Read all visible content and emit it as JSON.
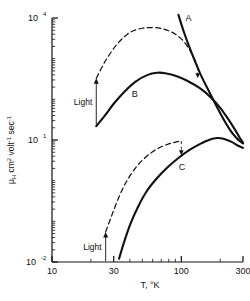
{
  "chart_data": {
    "type": "line",
    "title": "",
    "subtitle": "",
    "xlabel": "T,  °K",
    "ylabel": "μH cm2 volt-1 sec-1",
    "ylabel_parts": {
      "mu": "μ",
      "sub_h": "H",
      "cm": " cm",
      "cm_exp": "2",
      "volt": " volt",
      "volt_exp": "-1",
      "sec": " sec",
      "sec_exp": "-1"
    },
    "xscale": "log",
    "yscale": "log",
    "xlim": [
      10,
      300
    ],
    "ylim": [
      0.01,
      10000
    ],
    "grid": false,
    "legend_position": "inline-labels",
    "xticks": [
      {
        "value": 10,
        "label": "10",
        "major": true
      },
      {
        "value": 20,
        "label": "",
        "major": false
      },
      {
        "value": 30,
        "label": "30",
        "major": true
      },
      {
        "value": 40,
        "label": "",
        "major": false
      },
      {
        "value": 50,
        "label": "",
        "major": false
      },
      {
        "value": 60,
        "label": "",
        "major": false
      },
      {
        "value": 70,
        "label": "",
        "major": false
      },
      {
        "value": 80,
        "label": "",
        "major": false
      },
      {
        "value": 90,
        "label": "",
        "major": false
      },
      {
        "value": 100,
        "label": "100",
        "major": true
      },
      {
        "value": 200,
        "label": "",
        "major": false
      },
      {
        "value": 300,
        "label": "300",
        "major": true
      }
    ],
    "ytick_labels": [
      {
        "value": 10000,
        "mantissa": "10",
        "exponent": "4"
      },
      {
        "value": 10,
        "mantissa": "10",
        "exponent": "1"
      },
      {
        "value": 0.01,
        "mantissa": "10",
        "exponent": "-2"
      }
    ],
    "series": [
      {
        "name": "A",
        "label": "A",
        "style": "solid",
        "comment": "steeply falling branch from upper right",
        "points": [
          [
            95,
            12000
          ],
          [
            105,
            4400
          ],
          [
            120,
            1400
          ],
          [
            140,
            430
          ],
          [
            165,
            150
          ],
          [
            190,
            62
          ],
          [
            215,
            30
          ],
          [
            240,
            17
          ],
          [
            265,
            11.5
          ],
          [
            285,
            9.2
          ],
          [
            300,
            8.2
          ]
        ]
      },
      {
        "name": "B",
        "label": "B",
        "style": "solid",
        "comment": "dark-condition curve, peak near 60 K",
        "points": [
          [
            22,
            22
          ],
          [
            26,
            42
          ],
          [
            30,
            78
          ],
          [
            36,
            150
          ],
          [
            44,
            270
          ],
          [
            55,
            400
          ],
          [
            65,
            450
          ],
          [
            75,
            440
          ],
          [
            90,
            380
          ],
          [
            110,
            290
          ],
          [
            140,
            185
          ],
          [
            170,
            110
          ],
          [
            200,
            62
          ],
          [
            230,
            33
          ],
          [
            260,
            18
          ],
          [
            285,
            11
          ],
          [
            300,
            8.6
          ]
        ]
      },
      {
        "name": "B-light",
        "label": "",
        "style": "dashed",
        "comment": "curve B under illumination",
        "points": [
          [
            22,
            330
          ],
          [
            26,
            900
          ],
          [
            32,
            2300
          ],
          [
            40,
            4400
          ],
          [
            50,
            5600
          ],
          [
            62,
            5800
          ],
          [
            75,
            5200
          ],
          [
            90,
            4000
          ],
          [
            105,
            2600
          ],
          [
            118,
            1500
          ],
          [
            128,
            900
          ],
          [
            134,
            620
          ]
        ]
      },
      {
        "name": "C",
        "label": "C",
        "style": "solid",
        "comment": "lower dark curve, broad maximum near 190 K",
        "points": [
          [
            33,
            0.012
          ],
          [
            36,
            0.03
          ],
          [
            40,
            0.08
          ],
          [
            46,
            0.22
          ],
          [
            54,
            0.55
          ],
          [
            64,
            1.1
          ],
          [
            78,
            2.1
          ],
          [
            95,
            3.6
          ],
          [
            115,
            5.6
          ],
          [
            140,
            8.0
          ],
          [
            165,
            10.2
          ],
          [
            190,
            11.2
          ],
          [
            215,
            10.6
          ],
          [
            245,
            9.0
          ],
          [
            275,
            7.2
          ],
          [
            300,
            6.4
          ]
        ]
      },
      {
        "name": "C-light",
        "label": "",
        "style": "dashed",
        "comment": "curve C under illumination",
        "points": [
          [
            26,
            0.055
          ],
          [
            29,
            0.14
          ],
          [
            33,
            0.4
          ],
          [
            38,
            1.0
          ],
          [
            45,
            2.2
          ],
          [
            54,
            4.0
          ],
          [
            66,
            6.2
          ],
          [
            80,
            8.0
          ],
          [
            92,
            9.0
          ],
          [
            100,
            9.4
          ]
        ]
      }
    ],
    "annotations": [
      {
        "name": "light-arrow-upper",
        "text": "Light",
        "x_at": 22,
        "from_value": 22,
        "to_value": 330,
        "arrow": "up"
      },
      {
        "name": "light-arrow-lower",
        "text": "Light",
        "x_at": 26,
        "from_value": 0.0105,
        "to_value": 0.055,
        "arrow": "up"
      },
      {
        "name": "drop-marker-upper",
        "text": "",
        "x_at": 134,
        "from_value": 620,
        "to_value": 330,
        "arrow": "down-dashed"
      },
      {
        "name": "drop-marker-lower",
        "text": "",
        "x_at": 100,
        "from_value": 9.4,
        "to_value": 4.2,
        "arrow": "down-dashed"
      }
    ]
  }
}
